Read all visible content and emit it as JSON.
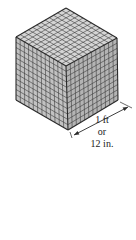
{
  "diagram": {
    "grid_divisions": 12,
    "vertices": {
      "top": [
        66,
        8
      ],
      "left_top": [
        16,
        37
      ],
      "right_top": [
        117,
        38
      ],
      "front_top": [
        66,
        66
      ],
      "left_bottom": [
        16,
        100
      ],
      "right_bottom": [
        118,
        100
      ],
      "front_bottom": [
        68,
        130
      ]
    },
    "colors": {
      "edge": "#2a2a2a",
      "grid_line": "#3a3a3a",
      "top_face": "#d4d4d4",
      "left_face": "#c2c2c2",
      "right_face": "#b4b4b4",
      "text": "#222222"
    },
    "dimension": {
      "line_start": [
        74,
        135
      ],
      "line_end": [
        128,
        107
      ],
      "label_lines": [
        "1 ft",
        "or",
        "12 in."
      ]
    }
  }
}
